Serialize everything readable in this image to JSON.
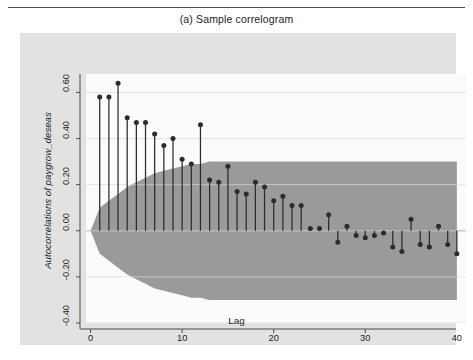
{
  "figure": {
    "title": "(a)  Sample correlogram",
    "note": "Bartlett's formula for MA(q) 95% confidence bands",
    "background": "#ffffff",
    "graph_region_color": "#e2e2e2",
    "plot_region_color": "#fbfbfb",
    "band_color": "#9a9a9a",
    "stem_color": "#2b2b2b",
    "axis_color": "#4a4a4a"
  },
  "chart_data": {
    "type": "bar",
    "title": "(a)  Sample correlogram",
    "subtitle": "",
    "xlabel": "Lag",
    "ylabel": "Autocorrelations of paygrow_deseas",
    "annotation": "Bartlett's formula for MA(q) 95% confidence bands",
    "xlim": [
      -0.5,
      41
    ],
    "ylim": [
      -0.4,
      0.68
    ],
    "xticks": [
      0,
      10,
      20,
      30,
      40
    ],
    "xticklabels": [
      "0",
      "10",
      "20",
      "30",
      "40"
    ],
    "yticks": [
      -0.4,
      -0.2,
      0.0,
      0.2,
      0.4,
      0.6
    ],
    "yticklabels": [
      "-0.40",
      "-0.20",
      "0.00",
      "0.20",
      "0.40",
      "0.60"
    ],
    "grid": true,
    "legend": null,
    "categories": [
      1,
      2,
      3,
      4,
      5,
      6,
      7,
      8,
      9,
      10,
      11,
      12,
      13,
      14,
      15,
      16,
      17,
      18,
      19,
      20,
      21,
      22,
      23,
      24,
      25,
      26,
      27,
      28,
      29,
      30,
      31,
      32,
      33,
      34,
      35,
      36,
      37,
      38,
      39,
      40
    ],
    "values": [
      0.58,
      0.58,
      0.64,
      0.49,
      0.47,
      0.47,
      0.42,
      0.37,
      0.4,
      0.31,
      0.29,
      0.46,
      0.22,
      0.21,
      0.28,
      0.17,
      0.16,
      0.21,
      0.19,
      0.13,
      0.15,
      0.11,
      0.11,
      0.01,
      0.01,
      0.07,
      -0.05,
      0.02,
      -0.02,
      -0.03,
      -0.02,
      -0.01,
      -0.07,
      -0.09,
      0.05,
      -0.06,
      -0.07,
      0.02,
      -0.06,
      -0.1
    ],
    "confidence_bands": {
      "label": "Bartlett 95% confidence band",
      "upper": [
        0.1,
        0.13,
        0.16,
        0.19,
        0.21,
        0.23,
        0.25,
        0.26,
        0.27,
        0.28,
        0.29,
        0.29,
        0.3,
        0.3,
        0.3,
        0.3,
        0.3,
        0.3,
        0.3,
        0.3,
        0.3,
        0.3,
        0.3,
        0.3,
        0.3,
        0.3,
        0.3,
        0.3,
        0.3,
        0.3,
        0.3,
        0.3,
        0.3,
        0.3,
        0.3,
        0.3,
        0.3,
        0.3,
        0.3,
        0.3
      ],
      "lower": [
        -0.1,
        -0.13,
        -0.16,
        -0.19,
        -0.21,
        -0.23,
        -0.25,
        -0.26,
        -0.27,
        -0.28,
        -0.29,
        -0.29,
        -0.3,
        -0.3,
        -0.3,
        -0.3,
        -0.3,
        -0.3,
        -0.3,
        -0.3,
        -0.3,
        -0.3,
        -0.3,
        -0.3,
        -0.3,
        -0.3,
        -0.3,
        -0.3,
        -0.3,
        -0.3,
        -0.3,
        -0.3,
        -0.3,
        -0.3,
        -0.3,
        -0.3,
        -0.3,
        -0.3,
        -0.3,
        -0.3
      ]
    }
  }
}
